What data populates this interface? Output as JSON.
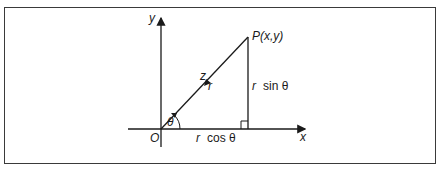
{
  "figure": {
    "type": "polar-coordinates-diagram",
    "labels": {
      "y_axis": "y",
      "x_axis": "x",
      "origin": "O",
      "point": "P(x,y)",
      "radius": "r",
      "z": "z",
      "angle": "θ",
      "vertical_side_var": "r",
      "vertical_side_fn": "sin θ",
      "horizontal_side_var": "r",
      "horizontal_side_fn": "cos θ"
    },
    "colors": {
      "stroke": "#1a1a1a",
      "border": "#3a3a3a",
      "background": "#ffffff"
    }
  }
}
